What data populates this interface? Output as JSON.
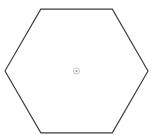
{
  "figure": {
    "title": "Regular hexagon with radial spokes",
    "background_color": "#ffffff",
    "width": 154,
    "height": 138
  },
  "chart_data": {
    "type": "diagram",
    "shape": "regular-hexagon",
    "orientation": "flat-top",
    "title": "Regular hexagon with radial spokes",
    "center": {
      "x": 76.5,
      "y": 71.0
    },
    "circumradius": 71.5,
    "inradius": 61.9,
    "vertex_count": 6,
    "spoke_count": 12,
    "spoke_angle_step_degrees": 30,
    "outline": {
      "style": "solid",
      "color": "#3c3c3c",
      "width": 1.15,
      "vertices": [
        {
          "label": "left",
          "x": 5.0,
          "y": 71.0,
          "angle": 180
        },
        {
          "label": "upper-left",
          "x": 40.8,
          "y": 9.1,
          "angle": 120
        },
        {
          "label": "upper-right",
          "x": 112.3,
          "y": 9.1,
          "angle": 60
        },
        {
          "label": "right",
          "x": 148.0,
          "y": 71.0,
          "angle": 0
        },
        {
          "label": "lower-right",
          "x": 112.3,
          "y": 132.9,
          "angle": -60
        },
        {
          "label": "lower-left",
          "x": 40.8,
          "y": 132.9,
          "angle": -120
        }
      ]
    },
    "spokes": {
      "style": "dashed",
      "color": "#bfbfbf",
      "width": 0.85,
      "dash_pattern": [
        3,
        2.4
      ],
      "to_vertices": [
        {
          "angle": 0,
          "x": 148.0,
          "y": 71.0
        },
        {
          "angle": 60,
          "x": 112.3,
          "y": 9.1
        },
        {
          "angle": 120,
          "x": 40.8,
          "y": 9.1
        },
        {
          "angle": 180,
          "x": 5.0,
          "y": 71.0
        },
        {
          "angle": 240,
          "x": 40.8,
          "y": 132.9
        },
        {
          "angle": 300,
          "x": 112.3,
          "y": 132.9
        }
      ],
      "to_edge_midpoints": [
        {
          "angle": 30,
          "x": 130.1,
          "y": 40.1
        },
        {
          "angle": 90,
          "x": 76.5,
          "y": 9.1
        },
        {
          "angle": 150,
          "x": 22.9,
          "y": 40.1
        },
        {
          "angle": 210,
          "x": 22.9,
          "y": 101.9
        },
        {
          "angle": 270,
          "x": 76.5,
          "y": 132.9
        },
        {
          "angle": 330,
          "x": 130.1,
          "y": 101.9
        }
      ]
    },
    "hub": {
      "label": "center-hub",
      "x": 76.5,
      "y": 71.0,
      "outer_radius": 3.0,
      "dot_radius": 1.1,
      "ring_color": "#b4b4b4",
      "dot_color": "#9a9a9a"
    },
    "legend": [],
    "annotations": []
  }
}
